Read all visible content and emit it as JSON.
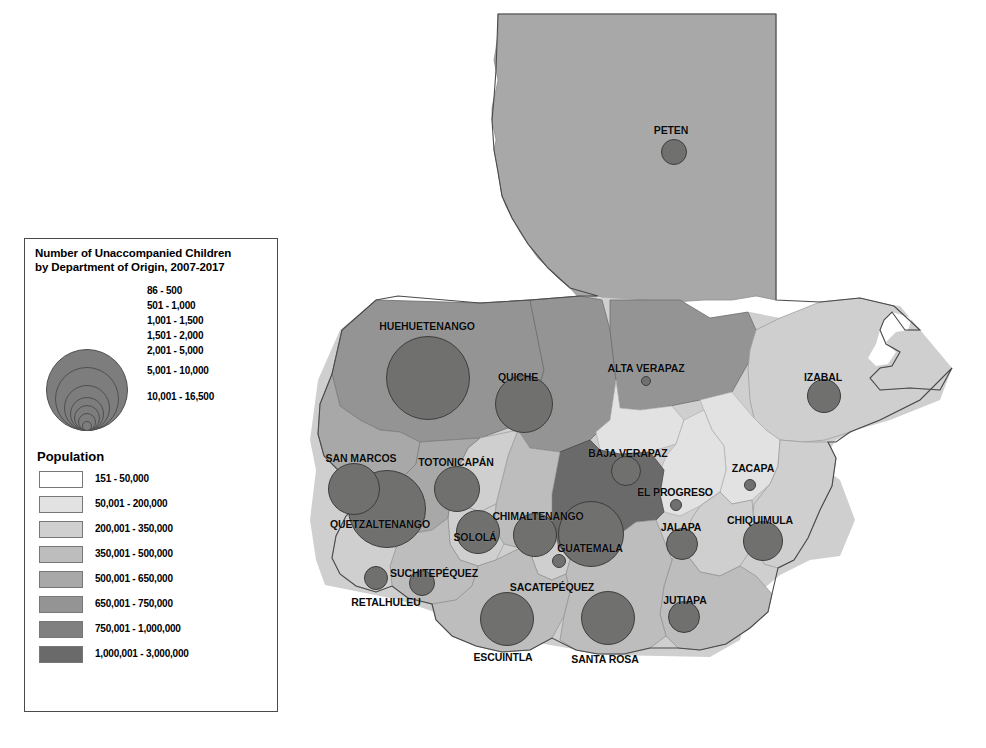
{
  "map": {
    "title": "Number of Unaccompanied Children by Department of Origin, 2007-2017",
    "country": "Guatemala",
    "bubble_legend": {
      "title_line1": "Number of Unaccompanied Children",
      "title_line2": "by Department of Origin, 2007-2017",
      "classes": [
        {
          "label": "86 - 500",
          "radius_px": 5
        },
        {
          "label": "501 - 1,000",
          "radius_px": 9
        },
        {
          "label": "1,001 - 1,500",
          "radius_px": 13
        },
        {
          "label": "1,501 - 2,000",
          "radius_px": 17
        },
        {
          "label": "2,001 - 5,000",
          "radius_px": 23
        },
        {
          "label": "5,001 - 10,000",
          "radius_px": 32
        },
        {
          "label": "10,001 - 16,500",
          "radius_px": 41
        }
      ]
    },
    "population_legend": {
      "title": "Population",
      "classes": [
        {
          "label": "151 - 50,000",
          "color": "#ffffff"
        },
        {
          "label": "50,001 - 200,000",
          "color": "#e2e2e2"
        },
        {
          "label": "200,001 - 350,000",
          "color": "#cfcfcf"
        },
        {
          "label": "350,001 - 500,000",
          "color": "#bdbdbd"
        },
        {
          "label": "500,001 - 650,000",
          "color": "#a8a8a8"
        },
        {
          "label": "650,001 - 750,000",
          "color": "#949494"
        },
        {
          "label": "750,001 - 1,000,000",
          "color": "#808080"
        },
        {
          "label": "1,000,001 - 3,000,000",
          "color": "#6a6a6a"
        }
      ]
    },
    "departments": [
      {
        "name": "PETEN",
        "label_x": 391,
        "label_y": 124,
        "cx": 394,
        "cy": 152,
        "r": 13,
        "fill": "#a8a8a8"
      },
      {
        "name": "HUEHUETENANGO",
        "label_x": 147,
        "label_y": 320,
        "cx": 148,
        "cy": 378,
        "r": 42,
        "fill": "#949494"
      },
      {
        "name": "QUICHE",
        "label_x": 238,
        "label_y": 371,
        "cx": 244,
        "cy": 404,
        "r": 29,
        "fill": "#949494"
      },
      {
        "name": "ALTA VERAPAZ",
        "label_x": 366,
        "label_y": 362,
        "cx": 366,
        "cy": 381,
        "r": 5,
        "fill": "#949494"
      },
      {
        "name": "IZABAL",
        "label_x": 543,
        "label_y": 371,
        "cx": 544,
        "cy": 396,
        "r": 17,
        "fill": "#cfcfcf"
      },
      {
        "name": "SAN MARCOS",
        "label_x": 81,
        "label_y": 452,
        "cx": 74,
        "cy": 489,
        "r": 26,
        "fill": "#a8a8a8"
      },
      {
        "name": "TOTONICAPÁN",
        "label_x": 176,
        "label_y": 456,
        "cx": 177,
        "cy": 489,
        "r": 23,
        "fill": "#cfcfcf"
      },
      {
        "name": "BAJA VERAPAZ",
        "label_x": 348,
        "label_y": 447,
        "cx": 346,
        "cy": 471,
        "r": 15,
        "fill": "#e2e2e2"
      },
      {
        "name": "ZACAPA",
        "label_x": 473,
        "label_y": 462,
        "cx": 470,
        "cy": 485,
        "r": 6,
        "fill": "#e2e2e2"
      },
      {
        "name": "QUETZALTENANGO",
        "label_x": 100,
        "label_y": 518,
        "cx": 107,
        "cy": 509,
        "r": 39,
        "fill": "#a8a8a8"
      },
      {
        "name": "SOLOLÁ",
        "label_x": 195,
        "label_y": 531,
        "cx": 198,
        "cy": 532,
        "r": 22,
        "fill": "#cfcfcf"
      },
      {
        "name": "CHIMALTENANGO",
        "label_x": 258,
        "label_y": 510,
        "cx": 255,
        "cy": 535,
        "r": 22,
        "fill": "#bdbdbd"
      },
      {
        "name": "EL PROGRESO",
        "label_x": 395,
        "label_y": 486,
        "cx": 396,
        "cy": 505,
        "r": 6,
        "fill": "#e2e2e2"
      },
      {
        "name": "GUATEMALA",
        "label_x": 310,
        "label_y": 542,
        "cx": 311,
        "cy": 534,
        "r": 33,
        "fill": "#6a6a6a"
      },
      {
        "name": "JALAPA",
        "label_x": 401,
        "label_y": 521,
        "cx": 402,
        "cy": 544,
        "r": 16,
        "fill": "#cfcfcf"
      },
      {
        "name": "CHIQUIMULA",
        "label_x": 480,
        "label_y": 514,
        "cx": 483,
        "cy": 541,
        "r": 20,
        "fill": "#cfcfcf"
      },
      {
        "name": "SUCHITEPÉQUEZ",
        "label_x": 154,
        "label_y": 567,
        "cx": 142,
        "cy": 583,
        "r": 13,
        "fill": "#bdbdbd"
      },
      {
        "name": "SACATEPÉQUEZ",
        "label_x": 272,
        "label_y": 581,
        "cx": 279,
        "cy": 561,
        "r": 7,
        "fill": "#cfcfcf"
      },
      {
        "name": "RETALHULEU",
        "label_x": 106,
        "label_y": 596,
        "cx": 96,
        "cy": 578,
        "r": 12,
        "fill": "#cfcfcf"
      },
      {
        "name": "JUTIAPA",
        "label_x": 405,
        "label_y": 594,
        "cx": 404,
        "cy": 617,
        "r": 16,
        "fill": "#bdbdbd"
      },
      {
        "name": "ESCUINTLA",
        "label_x": 223,
        "label_y": 651,
        "cx": 227,
        "cy": 619,
        "r": 27,
        "fill": "#bdbdbd"
      },
      {
        "name": "SANTA ROSA",
        "label_x": 325,
        "label_y": 653,
        "cx": 328,
        "cy": 618,
        "r": 27,
        "fill": "#bdbdbd"
      }
    ],
    "north_arrow": {
      "label": "N"
    },
    "scalebar": {
      "ticks": [
        "0",
        "25",
        "50",
        "100",
        "150"
      ],
      "unit": "KM"
    }
  }
}
